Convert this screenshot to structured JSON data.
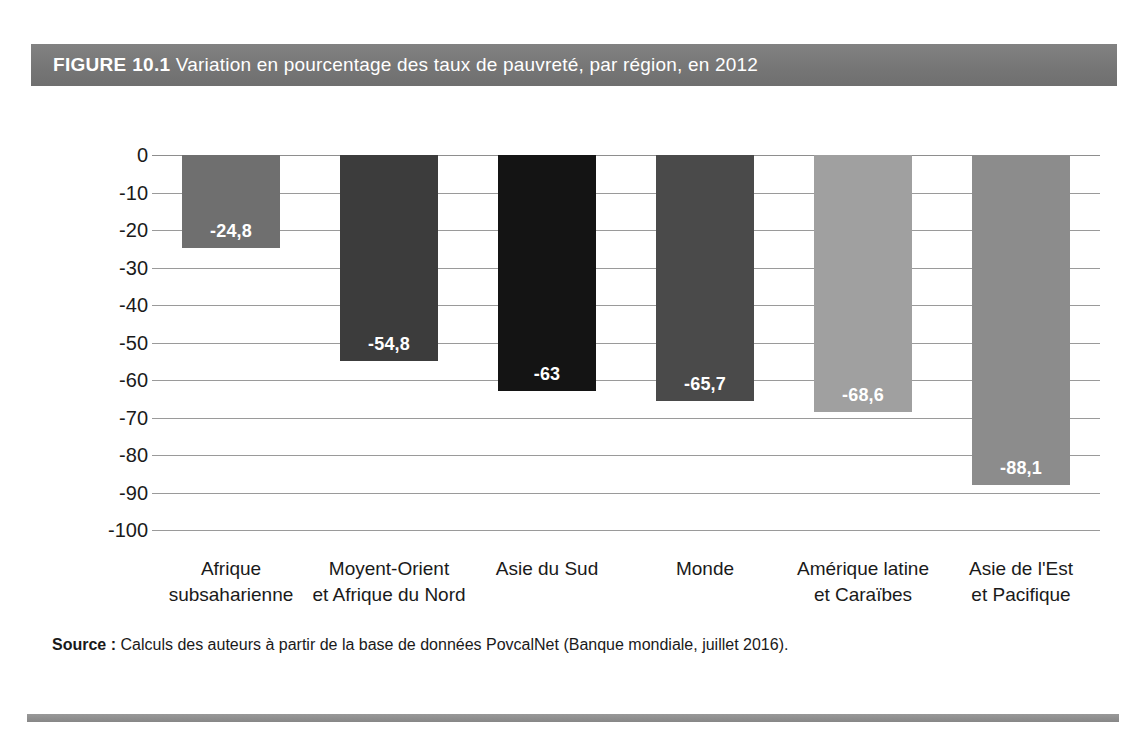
{
  "figure": {
    "label": "FIGURE 10.1",
    "caption": "Variation en pourcentage des taux de pauvreté, par région, en 2012",
    "band_color": "#7b7b7b",
    "rule_color": "#8d8d8d"
  },
  "source": {
    "label": "Source :",
    "text": "Calculs des auteurs à partir de la base de données PovcalNet (Banque mondiale, juillet 2016)."
  },
  "chart_data": {
    "type": "bar",
    "title": "Variation en pourcentage des taux de pauvreté, par région, en 2012",
    "xlabel": "",
    "ylabel": "",
    "ylim": [
      -100,
      0
    ],
    "grid": true,
    "legend": "none",
    "orientation": "vertical",
    "yticks": [
      0,
      -10,
      -20,
      -30,
      -40,
      -50,
      -60,
      -70,
      -80,
      -90,
      -100
    ],
    "ytick_labels": [
      "0",
      "-10",
      "-20",
      "-30",
      "-40",
      "-50",
      "-60",
      "-70",
      "-80",
      "-90",
      "-100"
    ],
    "categories": [
      "Afrique subsaharienne",
      "Moyent-Orient et Afrique du Nord",
      "Asie du Sud",
      "Monde",
      "Amérique latine et Caraïbes",
      "Asie de l'Est et Pacifique"
    ],
    "category_lines": [
      [
        "Afrique",
        "subsaharienne"
      ],
      [
        "Moyent-Orient",
        "et Afrique du Nord"
      ],
      [
        "Asie du Sud"
      ],
      [
        "Monde"
      ],
      [
        "Amérique latine",
        "et Caraïbes"
      ],
      [
        "Asie de l'Est",
        "et Pacifique"
      ]
    ],
    "values": [
      -24.8,
      -54.8,
      -63,
      -65.7,
      -68.6,
      -88.1
    ],
    "value_labels": [
      "-24,8",
      "-54,8",
      "-63",
      "-65,7",
      "-68,6",
      "-88,1"
    ],
    "bar_colors": [
      "#6f6f6f",
      "#3c3c3c",
      "#141414",
      "#4a4a4a",
      "#a0a0a0",
      "#8c8c8c"
    ]
  }
}
